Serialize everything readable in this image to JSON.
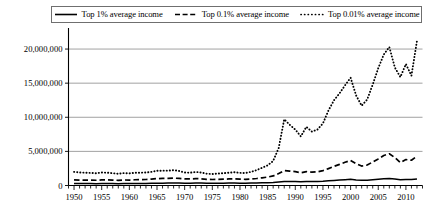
{
  "legend": {
    "position": "top",
    "entries": [
      {
        "label": "Top 1% average income",
        "style": "solid",
        "icon": "solid-line-icon"
      },
      {
        "label": "Top 0.1% average income",
        "style": "dashed",
        "icon": "dashed-line-icon"
      },
      {
        "label": "Top 0.01% average income",
        "style": "dotted",
        "icon": "dotted-line-icon"
      }
    ]
  },
  "chart_data": {
    "type": "line",
    "title": "",
    "xlabel": "",
    "ylabel": "",
    "xlim": [
      1949,
      2013
    ],
    "ylim": [
      0,
      22500000
    ],
    "grid": true,
    "legend_position": "top",
    "ytick_labels": [
      "0",
      "5,000,000",
      "10,000,000",
      "15,000,000",
      "20,000,000"
    ],
    "ytick_values": [
      0,
      5000000,
      10000000,
      15000000,
      20000000
    ],
    "xtick_labels": [
      "1950",
      "1955",
      "1960",
      "1965",
      "1970",
      "1975",
      "1980",
      "1985",
      "1990",
      "1995",
      "2000",
      "2005",
      "2010"
    ],
    "xtick_values": [
      1950,
      1955,
      1960,
      1965,
      1970,
      1975,
      1980,
      1985,
      1990,
      1995,
      2000,
      2005,
      2010
    ],
    "minor_xticks_every": 1,
    "x": [
      1950,
      1951,
      1952,
      1953,
      1954,
      1955,
      1956,
      1957,
      1958,
      1959,
      1960,
      1961,
      1962,
      1963,
      1964,
      1965,
      1966,
      1967,
      1968,
      1969,
      1970,
      1971,
      1972,
      1973,
      1974,
      1975,
      1976,
      1977,
      1978,
      1979,
      1980,
      1981,
      1982,
      1983,
      1984,
      1985,
      1986,
      1987,
      1988,
      1989,
      1990,
      1991,
      1992,
      1993,
      1994,
      1995,
      1996,
      1997,
      1998,
      1999,
      2000,
      2001,
      2002,
      2003,
      2004,
      2005,
      2006,
      2007,
      2008,
      2009,
      2010,
      2011,
      2012
    ],
    "series": [
      {
        "name": "Top 1% average income",
        "style": "solid",
        "color": "#000000",
        "values": [
          285000,
          280000,
          278000,
          276000,
          272000,
          282000,
          285000,
          280000,
          272000,
          285000,
          285000,
          295000,
          300000,
          305000,
          320000,
          340000,
          345000,
          350000,
          360000,
          355000,
          340000,
          340000,
          355000,
          350000,
          335000,
          325000,
          335000,
          340000,
          350000,
          355000,
          345000,
          340000,
          350000,
          365000,
          390000,
          410000,
          450000,
          520000,
          600000,
          600000,
          590000,
          560000,
          590000,
          580000,
          590000,
          620000,
          680000,
          740000,
          800000,
          850000,
          900000,
          820000,
          760000,
          780000,
          860000,
          930000,
          1000000,
          1030000,
          950000,
          830000,
          890000,
          890000,
          960000
        ]
      },
      {
        "name": "Top 0.1% average income",
        "style": "dashed",
        "color": "#000000",
        "values": [
          830000,
          800000,
          790000,
          780000,
          770000,
          820000,
          820000,
          790000,
          760000,
          810000,
          800000,
          840000,
          860000,
          880000,
          940000,
          1010000,
          1030000,
          1040000,
          1080000,
          1040000,
          960000,
          960000,
          1010000,
          980000,
          910000,
          880000,
          910000,
          930000,
          960000,
          980000,
          930000,
          910000,
          960000,
          1030000,
          1130000,
          1230000,
          1400000,
          1750000,
          2180000,
          2120000,
          2030000,
          1870000,
          2030000,
          1950000,
          2000000,
          2180000,
          2480000,
          2800000,
          3100000,
          3400000,
          3680000,
          3200000,
          2850000,
          3000000,
          3450000,
          3900000,
          4400000,
          4650000,
          4100000,
          3350000,
          3800000,
          3700000,
          4300000
        ]
      },
      {
        "name": "Top 0.01% average income",
        "style": "dotted",
        "color": "#000000",
        "values": [
          2000000,
          1920000,
          1880000,
          1850000,
          1800000,
          1900000,
          1880000,
          1800000,
          1720000,
          1820000,
          1780000,
          1860000,
          1880000,
          1900000,
          2000000,
          2150000,
          2180000,
          2180000,
          2250000,
          2130000,
          1900000,
          1880000,
          1980000,
          1900000,
          1730000,
          1680000,
          1760000,
          1800000,
          1880000,
          1950000,
          1850000,
          1830000,
          2000000,
          2250000,
          2600000,
          2950000,
          3600000,
          5500000,
          9700000,
          8900000,
          8200000,
          7200000,
          8600000,
          7900000,
          8200000,
          9100000,
          11000000,
          12500000,
          13500000,
          14700000,
          15800000,
          13200000,
          11700000,
          12600000,
          14800000,
          17200000,
          19200000,
          20300000,
          17300000,
          15900000,
          17800000,
          16100000,
          21200000
        ]
      }
    ]
  }
}
